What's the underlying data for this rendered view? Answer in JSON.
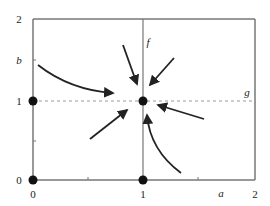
{
  "diagram": {
    "type": "phase-portrait",
    "colors": {
      "frame": "#777777",
      "dashed_line": "#999999",
      "arrow": "#222222",
      "dot": "#111111"
    },
    "axes": {
      "x_label": "a",
      "y_label": "b",
      "x_ticks": [
        {
          "value": "0",
          "x": 33
        },
        {
          "value": "1",
          "x": 143
        },
        {
          "value": "2",
          "x": 255
        }
      ],
      "y_ticks": [
        {
          "value": "2",
          "y": 19
        },
        {
          "value": "1",
          "y": 101
        },
        {
          "value": "0",
          "y": 180
        }
      ]
    },
    "lines": {
      "f_label": "f",
      "g_label": "g"
    },
    "equilibria": [
      {
        "name": "origin",
        "a": 0,
        "b": 0
      },
      {
        "name": "b-axis-point",
        "a": 0,
        "b": 1
      },
      {
        "name": "a-axis-point",
        "a": 1,
        "b": 0
      },
      {
        "name": "interior-stable",
        "a": 1,
        "b": 1
      }
    ],
    "trajectories": [
      {
        "name": "upper-left-curve",
        "shape": "curved"
      },
      {
        "name": "top-left-straight",
        "shape": "straight"
      },
      {
        "name": "top-right-straight",
        "shape": "straight"
      },
      {
        "name": "lower-left-straight",
        "shape": "straight"
      },
      {
        "name": "right-straight",
        "shape": "straight"
      },
      {
        "name": "lower-right-curve",
        "shape": "curved"
      }
    ]
  }
}
